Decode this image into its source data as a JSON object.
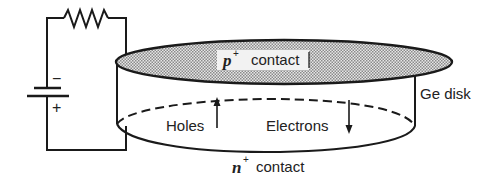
{
  "diagram": {
    "labels": {
      "p_contact_var": "p",
      "p_contact_sup": "+",
      "p_contact_text": "contact",
      "n_contact_var": "n",
      "n_contact_sup": "+",
      "n_contact_text": "contact",
      "ge_disk": "Ge disk",
      "holes": "Holes",
      "electrons": "Electrons",
      "battery_minus": "−",
      "battery_plus": "+"
    },
    "components": [
      "resistor",
      "battery",
      "germanium disk",
      "p+ contact (top, shaded)",
      "n+ contact (bottom)"
    ],
    "arrows": [
      {
        "label": "Holes",
        "direction": "up"
      },
      {
        "label": "Electrons",
        "direction": "down"
      }
    ],
    "colors": {
      "line": "#1a1a1a",
      "shading": "#bdbdbd",
      "background": "#ffffff"
    }
  }
}
